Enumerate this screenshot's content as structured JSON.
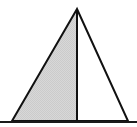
{
  "figure": {
    "name": "isosceles-triangle-with-altitude",
    "canvas": {
      "width": 137,
      "height": 127,
      "background_color": "#ffffff"
    },
    "colors": {
      "stroke": "#111111",
      "shaded_fill": "#d4d4d4",
      "unshaded_fill": "#ffffff",
      "baseline": "#1a1a1a"
    },
    "stroke_width": 2,
    "vertices": {
      "apex": {
        "label": "apex",
        "x": 77,
        "y": 9
      },
      "bottom_left": {
        "label": "bottom-left",
        "x": 12,
        "y": 121
      },
      "bottom_right": {
        "label": "bottom-right",
        "x": 128,
        "y": 121
      },
      "base_midpoint": {
        "label": "base-midpoint",
        "x": 77,
        "y": 121
      }
    },
    "paths": {
      "triangle_outline": "M 77 9 L 12 121 L 128 121 Z",
      "left_half_region": "M 77 9 L 12 121 L 77 121 Z",
      "right_half_region": "M 77 9 L 77 121 L 128 121 Z",
      "altitude_line": "M 77 9 L 77 121"
    },
    "baseline_rule": {
      "x1": 0,
      "y1": 122,
      "x2": 137,
      "y2": 122
    },
    "regions": [
      {
        "name": "left-half",
        "shaded": "shaded",
        "fill": "#d4d4d4"
      },
      {
        "name": "right-half",
        "shaded": "unshaded",
        "fill": "#ffffff"
      }
    ]
  }
}
